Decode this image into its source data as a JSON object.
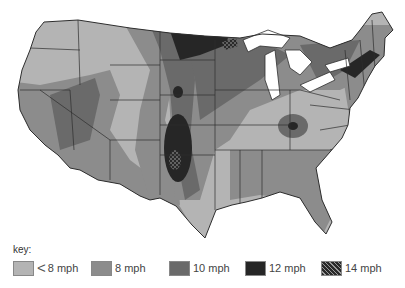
{
  "map": {
    "subject": "Average wind speed, contiguous United States",
    "colors": {
      "lt8": "#b4b4b4",
      "8": "#8c8c8c",
      "10": "#6a6a6a",
      "12": "#262626",
      "14": "#4a4a4a",
      "water": "#ffffff",
      "border": "#2e2e2e"
    }
  },
  "legend": {
    "title": "key:",
    "items": [
      {
        "lt": "<",
        "label": "8 mph",
        "class": "lt8"
      },
      {
        "lt": "",
        "label": "8 mph",
        "class": "8"
      },
      {
        "lt": "",
        "label": "10 mph",
        "class": "10"
      },
      {
        "lt": "",
        "label": "12 mph",
        "class": "12"
      },
      {
        "lt": "",
        "label": "14 mph",
        "class": "14"
      }
    ]
  }
}
